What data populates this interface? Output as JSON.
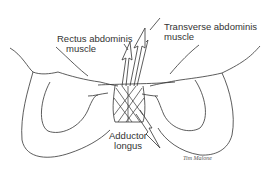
{
  "diagram": {
    "labels": {
      "rectus": {
        "line1": "Rectus abdominis",
        "line2": "muscle"
      },
      "transverse": {
        "line1": "Transverse abdominis",
        "line2": "muscle"
      },
      "adductor": {
        "line1": "Adductor",
        "line2": "longus"
      }
    },
    "signature": "Tim Malone",
    "line_color": "#333333"
  }
}
